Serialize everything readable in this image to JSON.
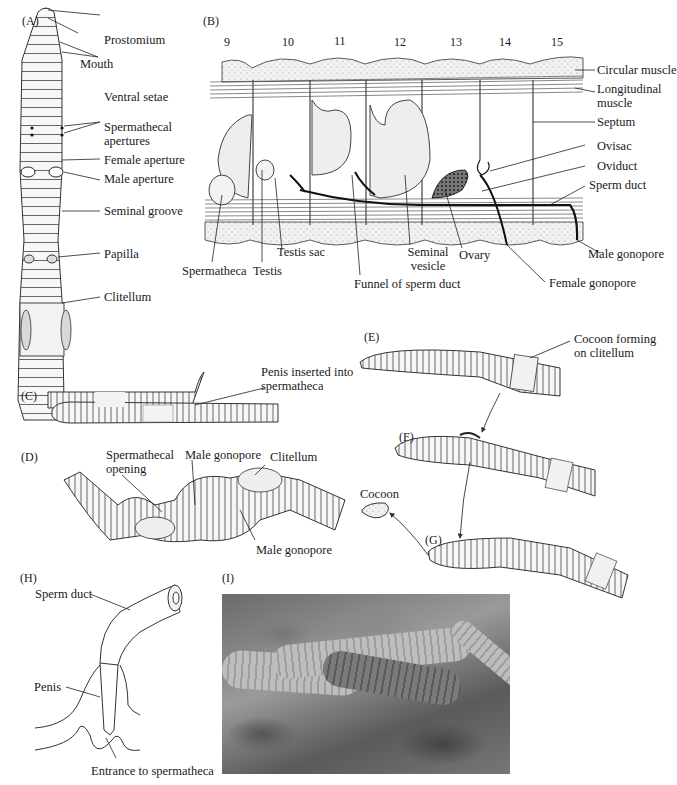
{
  "figure": {
    "panels": {
      "A": {
        "tag": "(A)",
        "labels": {
          "prostomium": "Prostomium",
          "mouth": "Mouth",
          "ventral_setae": "Ventral setae",
          "spermathecal_apertures": "Spermathecal apertures",
          "female_aperture": "Female aperture",
          "male_aperture": "Male aperture",
          "seminal_groove": "Seminal groove",
          "papilla": "Papilla",
          "clitellum": "Clitellum"
        }
      },
      "B": {
        "tag": "(B)",
        "segment_numbers": [
          "9",
          "10",
          "11",
          "12",
          "13",
          "14",
          "15"
        ],
        "labels": {
          "circular_muscle": "Circular muscle",
          "longitudinal_muscle": "Longitudinal muscle",
          "septum": "Septum",
          "ovisac": "Ovisac",
          "oviduct": "Oviduct",
          "sperm_duct": "Sperm duct",
          "male_gonopore": "Male gonopore",
          "female_gonopore": "Female gonopore",
          "ovary": "Ovary",
          "seminal_vesicle": "Seminal vesicle",
          "funnel_of_sperm_duct": "Funnel of sperm duct",
          "testis_sac": "Testis sac",
          "testis": "Testis",
          "spermatheca": "Spermatheca"
        }
      },
      "C": {
        "tag": "(C)",
        "labels": {
          "penis_inserted": "Penis inserted into spermatheca"
        }
      },
      "D": {
        "tag": "(D)",
        "labels": {
          "spermathecal_opening": "Spermathecal opening",
          "male_gonopore_top": "Male gonopore",
          "clitellum": "Clitellum",
          "male_gonopore_bottom": "Male gonopore"
        }
      },
      "E": {
        "tag": "(E)",
        "labels": {
          "cocoon_forming": "Cocoon forming on clitellum"
        }
      },
      "F": {
        "tag": "(F)"
      },
      "G": {
        "tag": "(G)",
        "labels": {
          "cocoon": "Cocoon"
        }
      },
      "H": {
        "tag": "(H)",
        "labels": {
          "sperm_duct": "Sperm duct",
          "penis": "Penis",
          "entrance": "Entrance to spermatheca"
        }
      },
      "I": {
        "tag": "(I)"
      }
    },
    "colors": {
      "ink": "#1a1a1a",
      "stipple": "#d9d9d9",
      "organ_fill": "#ececec",
      "background": "#ffffff"
    }
  }
}
